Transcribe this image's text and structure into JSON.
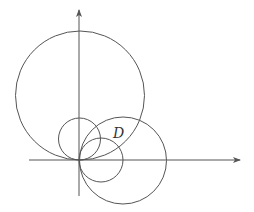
{
  "diagram": {
    "type": "circles-in-polar-coordinates",
    "colors": {
      "stroke": "#555555",
      "axis": "#555555",
      "background": "#ffffff",
      "label": "#333333"
    },
    "origin": {
      "x": 79,
      "y": 160
    },
    "axes": {
      "x_axis": {
        "x1": 29,
        "x2": 240,
        "y": 160,
        "arrow": true
      },
      "y_axis": {
        "x": 79,
        "y1": 196,
        "y2": 10,
        "arrow": true
      }
    },
    "circles": [
      {
        "name": "large-upper-circle",
        "cx": 80,
        "cy": 95.5,
        "r": 64.5
      },
      {
        "name": "small-upper-circle",
        "cx": 79.5,
        "cy": 139,
        "r": 21
      },
      {
        "name": "large-right-circle",
        "cx": 123,
        "cy": 160.5,
        "r": 43.5
      },
      {
        "name": "small-right-circle",
        "cx": 101,
        "cy": 160,
        "r": 22
      }
    ],
    "labels": [
      {
        "name": "region-D-label",
        "text": "D",
        "x": 113,
        "y": 126
      }
    ]
  }
}
